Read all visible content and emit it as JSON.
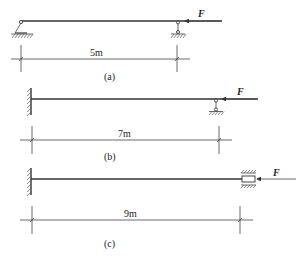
{
  "figures": [
    {
      "id": "a",
      "caption": "(a)",
      "span_label": "5m",
      "force_label": "F",
      "left_support": "pin",
      "right_support": "roller",
      "force_direction": "left"
    },
    {
      "id": "b",
      "caption": "(b)",
      "span_label": "7m",
      "force_label": "F",
      "left_support": "fixed-wall",
      "right_support": "roller",
      "force_direction": "left"
    },
    {
      "id": "c",
      "caption": "(c)",
      "span_label": "9m",
      "force_label": "F",
      "left_support": "fixed-wall",
      "right_support": "horizontal-slider",
      "force_direction": "left"
    }
  ],
  "colors": {
    "line": "#333333",
    "background": "#ffffff"
  }
}
